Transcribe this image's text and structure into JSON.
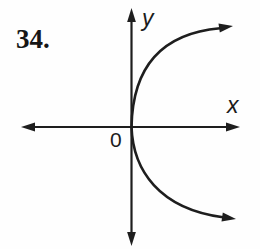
{
  "problem": {
    "number": "34."
  },
  "graph": {
    "y_axis_label": "y",
    "x_axis_label": "x",
    "origin_label": "0"
  },
  "colors": {
    "ink": "#1e1e1e",
    "background": "#fefefe"
  }
}
